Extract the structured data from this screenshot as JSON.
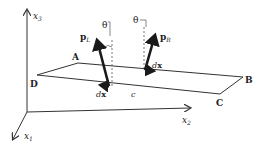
{
  "diagram": {
    "axes": {
      "x1": {
        "label": "x",
        "sub": "1"
      },
      "x2": {
        "label": "x",
        "sub": "2"
      },
      "x3": {
        "label": "x",
        "sub": "3"
      }
    },
    "plane": {
      "corners": {
        "A": "A",
        "B": "B",
        "C": "C",
        "D": "D"
      },
      "center_label": "c"
    },
    "vectors": {
      "left": {
        "label": "p",
        "sub": "L",
        "angle_label": "θ",
        "dx_label": "dx"
      },
      "right": {
        "label": "p",
        "sub": "R",
        "angle_label": "θ",
        "dx_label": "dx"
      }
    },
    "colors": {
      "stroke": "#333333",
      "vector": "#1a1a1a",
      "background": "#ffffff"
    }
  }
}
